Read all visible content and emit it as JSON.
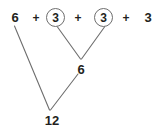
{
  "diagram": {
    "type": "number-bond-decomposition",
    "background_color": "#ffffff",
    "ink_color": "#231f20",
    "line_color": "#6e6e6e",
    "expression": {
      "terms": [
        {
          "value": "6",
          "circled": false
        },
        {
          "value": "3",
          "circled": true
        },
        {
          "value": "3",
          "circled": true
        },
        {
          "value": "3",
          "circled": false
        }
      ],
      "operators": [
        "+",
        "+",
        "+"
      ]
    },
    "nodes": [
      {
        "label": "6",
        "level": "intermediate"
      },
      {
        "label": "12",
        "level": "total"
      }
    ],
    "connectors": [
      {
        "from": "term-1-circled-3",
        "to": "node-6"
      },
      {
        "from": "term-2-circled-3",
        "to": "node-6"
      },
      {
        "from": "term-0-6",
        "to": "node-12"
      },
      {
        "from": "node-6",
        "to": "node-12"
      }
    ]
  }
}
